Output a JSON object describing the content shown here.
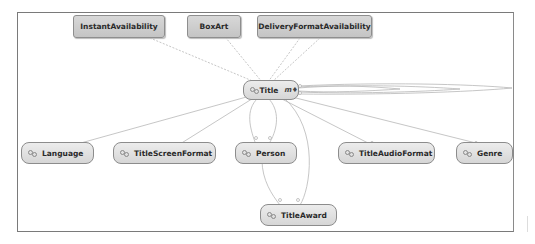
{
  "diagram": {
    "type": "entity-relationship",
    "nodes": [
      {
        "id": "instant",
        "label": "InstantAvailability",
        "style": "box"
      },
      {
        "id": "boxart",
        "label": "BoxArt",
        "style": "box"
      },
      {
        "id": "delivery",
        "label": "DeliveryFormatAvailability",
        "style": "box"
      },
      {
        "id": "title",
        "label": "Title",
        "style": "entity",
        "expand_glyph": "m♦"
      },
      {
        "id": "language",
        "label": "Language",
        "style": "entity"
      },
      {
        "id": "screen",
        "label": "TitleScreenFormat",
        "style": "entity"
      },
      {
        "id": "person",
        "label": "Person",
        "style": "entity"
      },
      {
        "id": "audio",
        "label": "TitleAudioFormat",
        "style": "entity"
      },
      {
        "id": "genre",
        "label": "Genre",
        "style": "entity"
      },
      {
        "id": "award",
        "label": "TitleAward",
        "style": "entity"
      }
    ],
    "edges": [
      {
        "from": "title",
        "to": "instant"
      },
      {
        "from": "title",
        "to": "boxart"
      },
      {
        "from": "title",
        "to": "delivery"
      },
      {
        "from": "title",
        "to": "delivery"
      },
      {
        "from": "title",
        "to": "title",
        "kind": "self-loop"
      },
      {
        "from": "title",
        "to": "language"
      },
      {
        "from": "title",
        "to": "screen"
      },
      {
        "from": "title",
        "to": "person"
      },
      {
        "from": "title",
        "to": "person"
      },
      {
        "from": "title",
        "to": "audio"
      },
      {
        "from": "title",
        "to": "genre"
      },
      {
        "from": "title",
        "to": "award"
      },
      {
        "from": "person",
        "to": "award"
      }
    ]
  }
}
